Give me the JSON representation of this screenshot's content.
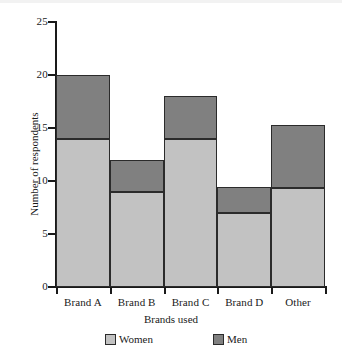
{
  "chart_data": {
    "type": "bar",
    "subtype": "stacked-vertical",
    "title": "",
    "xlabel": "Brands used",
    "ylabel": "Number of respondents",
    "categories": [
      "Brand A",
      "Brand B",
      "Brand C",
      "Brand D",
      "Other"
    ],
    "series": [
      {
        "name": "Women",
        "color": "#c2c2c2",
        "values": [
          14,
          9,
          14,
          7,
          9.3
        ]
      },
      {
        "name": "Men",
        "color": "#808080",
        "values": [
          6,
          3,
          4,
          2.4,
          6
        ]
      }
    ],
    "totals": [
      20,
      12,
      18,
      9.4,
      15.3
    ],
    "ylim": [
      0,
      25
    ],
    "yticks": [
      0,
      5,
      10,
      15,
      20,
      25
    ],
    "ytick_labels": [
      "0",
      "5",
      "10",
      "15",
      "20",
      "25"
    ],
    "grid": false,
    "legend_position": "bottom",
    "legend_entries": [
      "Women",
      "Men"
    ]
  },
  "axis": {
    "y_title": "Number of respondents",
    "x_title": "Brands used"
  },
  "legend": {
    "women_label": "Women",
    "men_label": "Men"
  }
}
